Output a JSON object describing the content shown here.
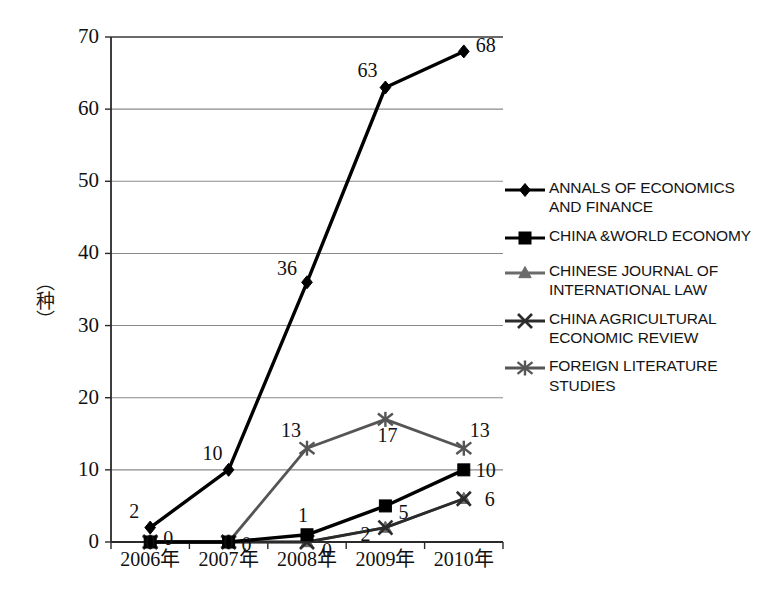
{
  "chart_data": {
    "type": "line",
    "title": "",
    "xlabel": "",
    "ylabel": "（种）",
    "categories": [
      "2006年",
      "2007年",
      "2008年",
      "2009年",
      "2010年"
    ],
    "ylim": [
      0,
      70
    ],
    "y_ticks": [
      "0",
      "10",
      "20",
      "30",
      "40",
      "50",
      "60",
      "70"
    ],
    "grid": true,
    "legend_position": "right",
    "series": [
      {
        "name": "ANNALS OF ECONOMICS AND FINANCE",
        "marker": "diamond",
        "color": "#000000",
        "values": [
          2,
          10,
          36,
          63,
          68
        ],
        "labels": [
          "2",
          "10",
          "36",
          "63",
          "68"
        ]
      },
      {
        "name": "CHINA &WORLD ECONOMY",
        "marker": "square",
        "color": "#000000",
        "values": [
          0,
          0,
          1,
          5,
          10
        ],
        "labels": [
          "0",
          "0",
          "1",
          "5",
          "10"
        ]
      },
      {
        "name": "CHINESE JOURNAL OF INTERNATIONAL LAW",
        "marker": "triangle",
        "color": "#6b6b6b",
        "values": [
          0,
          0,
          0,
          2,
          6
        ],
        "labels": [
          "",
          "",
          "0",
          "",
          ""
        ]
      },
      {
        "name": "CHINA AGRICULTURAL ECONOMIC REVIEW",
        "marker": "x",
        "color": "#2b2b2b",
        "values": [
          0,
          0,
          0,
          2,
          6
        ],
        "labels": [
          "0",
          "0",
          "",
          "2",
          "6"
        ]
      },
      {
        "name": "FOREIGN LITERATURE STUDIES",
        "marker": "asterisk",
        "color": "#555555",
        "values": [
          0,
          0,
          13,
          17,
          13
        ],
        "labels": [
          "",
          "",
          "13",
          "17",
          "13"
        ]
      }
    ]
  },
  "legend": {
    "items": [
      {
        "label": "ANNALS OF ECONOMICS\nAND FINANCE",
        "marker": "diamond"
      },
      {
        "label": "CHINA &WORLD ECONOMY",
        "marker": "square"
      },
      {
        "label": "CHINESE JOURNAL OF\nINTERNATIONAL LAW",
        "marker": "triangle"
      },
      {
        "label": "CHINA AGRICULTURAL\nECONOMIC REVIEW",
        "marker": "x"
      },
      {
        "label": "FOREIGN LITERATURE\nSTUDIES",
        "marker": "asterisk"
      }
    ]
  },
  "axes": {
    "y_title": "（种）"
  }
}
